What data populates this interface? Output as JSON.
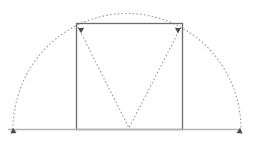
{
  "figure": {
    "title": "",
    "width": 256,
    "height": 146,
    "background_color": "#ffffff"
  },
  "colors": {
    "rectangle_stroke": "#6b6b6b",
    "baseline_stroke": "#b3b3b3",
    "dashed_stroke": "#9a9aa8",
    "arrowhead_fill": "#4a4a4a"
  },
  "geometry": {
    "baseline": {
      "name": "ground-line",
      "x1": 8,
      "y1": 129.5,
      "x2": 241,
      "y2": 129.5,
      "stroke_width": 1.6,
      "dashed": false
    },
    "arc": {
      "name": "semicircular-arc",
      "center_x": 127,
      "center_y": 129.5,
      "radius_x": 114,
      "radius_y": 116,
      "start_x": 13,
      "start_y": 129.5,
      "end_x": 241,
      "end_y": 129.5,
      "apex_x": 127,
      "apex_y": 13.5,
      "dashed": true,
      "dash_pattern": "1.6 2.2",
      "stroke_width": 1.1
    },
    "rectangle": {
      "name": "inscribed-rectangle",
      "x": 76.5,
      "y": 23.5,
      "width": 106,
      "height": 106,
      "stroke_width": 1.3,
      "filled": false,
      "dashed": false
    },
    "chevron": {
      "name": "v-chevron",
      "left_x": 78,
      "left_y": 27,
      "vertex_x": 129,
      "vertex_y": 128,
      "right_x": 181,
      "right_y": 27,
      "dashed": true,
      "dash_pattern": "1.6 2.2",
      "stroke_width": 1.1
    },
    "arrowheads": [
      {
        "name": "arrowhead-top-left",
        "x": 78,
        "y": 28,
        "rotation": 118,
        "size": 5.0
      },
      {
        "name": "arrowhead-top-right",
        "x": 181,
        "y": 28,
        "rotation": 242,
        "size": 5.0
      },
      {
        "name": "arrowhead-arc-left-end",
        "x": 13,
        "y": 128,
        "rotation": 175,
        "size": 5.0
      },
      {
        "name": "arrowhead-arc-right-end",
        "x": 240,
        "y": 128,
        "rotation": 185,
        "size": 5.0
      }
    ]
  }
}
